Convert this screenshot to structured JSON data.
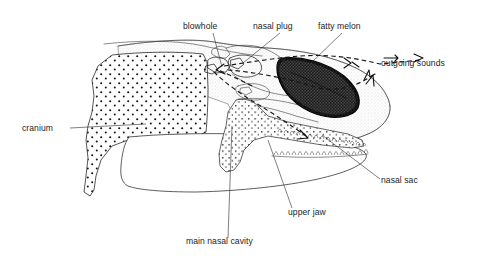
{
  "figure": {
    "type": "anatomical-line-diagram",
    "background_color": "#ffffff",
    "ink_color": "#1a1a1a",
    "label_font_size_px": 8.6
  },
  "labels": {
    "blowhole": "blowhole",
    "nasal_plug": "nasal plug",
    "fatty_melon": "fatty melon",
    "outgoing_sounds": "outgoing sounds",
    "cranium": "cranium",
    "nasal_sac": "nasal sac",
    "upper_jaw": "upper jaw",
    "main_nasal_cavity": "main nasal cavity"
  },
  "label_positions": [
    {
      "key": "blowhole",
      "text": "blowhole",
      "x": 183,
      "y": 29,
      "anchor": "start"
    },
    {
      "key": "nasal_plug",
      "text": "nasal plug",
      "x": 253,
      "y": 29,
      "anchor": "start"
    },
    {
      "key": "fatty_melon",
      "text": "fatty melon",
      "x": 318,
      "y": 29,
      "anchor": "start"
    },
    {
      "key": "outgoing_sounds",
      "text": "outgoing sounds",
      "x": 381,
      "y": 66,
      "anchor": "start"
    },
    {
      "key": "cranium",
      "text": "cranium",
      "x": 22,
      "y": 131,
      "anchor": "start"
    },
    {
      "key": "nasal_sac",
      "text": "nasal sac",
      "x": 381,
      "y": 183,
      "anchor": "start"
    },
    {
      "key": "upper_jaw",
      "text": "upper jaw",
      "x": 288,
      "y": 215,
      "anchor": "start"
    },
    {
      "key": "main_nasal_cavity",
      "text": "main nasal cavity",
      "x": 186,
      "y": 244,
      "anchor": "start"
    }
  ],
  "structures": [
    {
      "key": "cranium",
      "name": "cranium",
      "fill": "stipple-coarse-dots",
      "description": "large dotted skull mass at left"
    },
    {
      "key": "soft-tissue",
      "name": "soft tissue envelope",
      "fill": "fine-stipple-gray",
      "description": "light stippled head profile"
    },
    {
      "key": "fatty-melon",
      "name": "fatty melon",
      "fill": "dark-dense-stipple",
      "description": "dark lens-shaped melon in forehead"
    },
    {
      "key": "upper-jaw",
      "name": "upper jaw",
      "fill": "stipple-medium-dots",
      "description": "dotted Y-shaped maxilla"
    },
    {
      "key": "lower-jaw",
      "name": "lower jaw",
      "fill": "none",
      "description": "unfilled mandible outline"
    },
    {
      "key": "nasal-plug",
      "name": "nasal plug",
      "fill": "none",
      "description": "small valve structure below blowhole"
    },
    {
      "key": "nasal-sac",
      "name": "nasal sac",
      "fill": "none",
      "description": "air sac near the nasal passage"
    },
    {
      "key": "main-nasal-cavity",
      "name": "main nasal cavity",
      "fill": "none",
      "description": "open passage beneath the cranium"
    }
  ],
  "sound_paths": {
    "style": "dashed",
    "arrow_count": 6,
    "description": "dashed rays radiating from the nasal plug region forward through the fatty melon and out of the forehead"
  }
}
